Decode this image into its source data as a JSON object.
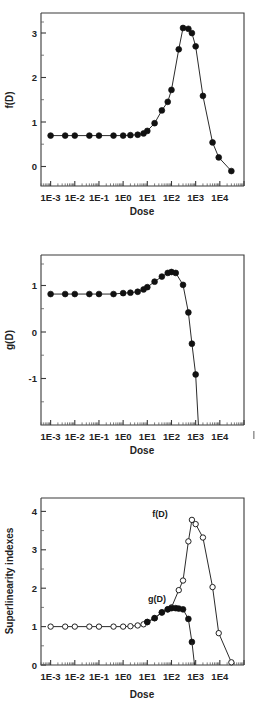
{
  "figure": {
    "panels": [
      {
        "id": "panel-f",
        "ylabel": "f(D)",
        "xlabel": "Dose",
        "y_ticks": [
          "0",
          "1",
          "2",
          "3"
        ],
        "x_ticks": [
          "1E-3",
          "1E-2",
          "1E-1",
          "1E0",
          "1E1",
          "1E2",
          "1E3",
          "1E4"
        ]
      },
      {
        "id": "panel-g",
        "ylabel": "g(D)",
        "xlabel": "Dose",
        "y_ticks": [
          "-1",
          "0",
          "1"
        ],
        "x_ticks": [
          "1E-3",
          "1E-2",
          "1E-1",
          "1E0",
          "1E1",
          "1E2",
          "1E3",
          "1E4"
        ]
      },
      {
        "id": "panel-combined",
        "ylabel": "Superlinearity indexes",
        "xlabel": "Dose",
        "y_ticks": [
          "0",
          "1",
          "2",
          "3",
          "4"
        ],
        "x_ticks": [
          "1E-3",
          "1E-2",
          "1E-1",
          "1E0",
          "1E1",
          "1E2",
          "1E3",
          "1E4"
        ],
        "annotations": [
          "f(D)",
          "g(D)"
        ]
      }
    ]
  },
  "chart_data": [
    {
      "type": "line",
      "title": "",
      "xlabel": "Dose",
      "ylabel": "f(D)",
      "xscale": "log",
      "xlim": [
        0.0004,
        100000
      ],
      "ylim": [
        -0.35,
        3.7
      ],
      "grid": false,
      "legend": "none",
      "marker": "filled-circle",
      "xticks": [
        0.001,
        0.01,
        0.1,
        1,
        10,
        100,
        1000,
        10000
      ],
      "xticklabels": [
        "1E-3",
        "1E-2",
        "1E-1",
        "1E0",
        "1E1",
        "1E2",
        "1E3",
        "1E4"
      ],
      "yticks": [
        0,
        1,
        2,
        3
      ],
      "series": [
        {
          "name": "f(D)",
          "x": [
            0.001,
            0.004,
            0.01,
            0.04,
            0.1,
            0.4,
            1.0,
            2.0,
            4.0,
            7.0,
            10.0,
            20.0,
            40.0,
            70.0,
            100.0,
            200.0,
            300.0,
            500.0,
            700.0,
            1000.0,
            2000.0,
            5000.0,
            9000.0,
            30000.0
          ],
          "y": [
            0.83,
            0.83,
            0.83,
            0.83,
            0.83,
            0.83,
            0.83,
            0.84,
            0.85,
            0.88,
            0.94,
            1.12,
            1.42,
            1.62,
            1.9,
            2.85,
            3.35,
            3.33,
            3.23,
            2.92,
            1.76,
            0.67,
            0.32,
            0.0
          ]
        }
      ]
    },
    {
      "type": "line",
      "title": "",
      "xlabel": "Dose",
      "ylabel": "g(D)",
      "xscale": "log",
      "xlim": [
        0.0004,
        100000
      ],
      "ylim": [
        -1.85,
        1.85
      ],
      "grid": false,
      "legend": "none",
      "marker": "filled-circle",
      "xticks": [
        0.001,
        0.01,
        0.1,
        1,
        10,
        100,
        1000,
        10000
      ],
      "xticklabels": [
        "1E-3",
        "1E-2",
        "1E-1",
        "1E0",
        "1E1",
        "1E2",
        "1E3",
        "1E4"
      ],
      "yticks": [
        -1,
        0,
        1
      ],
      "series": [
        {
          "name": "g(D)",
          "x": [
            0.001,
            0.004,
            0.01,
            0.04,
            0.1,
            0.4,
            1.0,
            2.0,
            4.0,
            7.0,
            10.0,
            20.0,
            40.0,
            70.0,
            100.0,
            150.0,
            300.0,
            500.0,
            700.0,
            1000.0,
            1300.0
          ],
          "y": [
            1.0,
            1.0,
            1.0,
            1.0,
            1.0,
            1.0,
            1.02,
            1.03,
            1.05,
            1.1,
            1.15,
            1.27,
            1.38,
            1.46,
            1.48,
            1.46,
            1.2,
            0.6,
            -0.08,
            -0.75,
            -1.9
          ]
        }
      ]
    },
    {
      "type": "line",
      "title": "",
      "xlabel": "Dose",
      "ylabel": "Superlinearity indexes",
      "xscale": "log",
      "xlim": [
        0.0004,
        100000
      ],
      "ylim": [
        0,
        4.35
      ],
      "grid": false,
      "legend": "annotated",
      "xticks": [
        0.001,
        0.01,
        0.1,
        1,
        10,
        100,
        1000,
        10000
      ],
      "xticklabels": [
        "1E-3",
        "1E-2",
        "1E-1",
        "1E0",
        "1E1",
        "1E2",
        "1E3",
        "1E4"
      ],
      "yticks": [
        0,
        1,
        2,
        3,
        4
      ],
      "series": [
        {
          "name": "f(D)",
          "marker": "open-circle",
          "x": [
            0.001,
            0.004,
            0.01,
            0.04,
            0.1,
            0.4,
            1.0,
            2.0,
            4.0,
            7.0,
            10.0,
            20.0,
            40.0,
            70.0,
            100.0,
            200.0,
            300.0,
            500.0,
            700.0,
            1000.0,
            2000.0,
            5000.0,
            9000.0,
            30000.0
          ],
          "y": [
            1.0,
            1.0,
            1.0,
            1.0,
            1.0,
            1.0,
            1.0,
            1.01,
            1.03,
            1.06,
            1.12,
            1.22,
            1.37,
            1.45,
            1.5,
            1.95,
            2.2,
            3.22,
            3.78,
            3.67,
            3.32,
            2.03,
            0.83,
            0.07
          ]
        },
        {
          "name": "g(D)",
          "marker": "filled-circle",
          "x": [
            10.0,
            20.0,
            40.0,
            70.0,
            100.0,
            150.0,
            200.0,
            300.0,
            500.0,
            700.0
          ],
          "y": [
            1.12,
            1.22,
            1.37,
            1.45,
            1.48,
            1.48,
            1.47,
            1.45,
            1.2,
            0.6
          ]
        }
      ]
    }
  ]
}
